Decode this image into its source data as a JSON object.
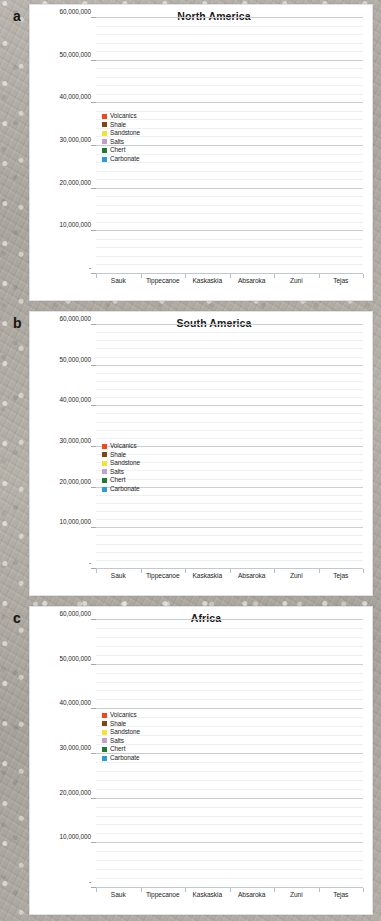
{
  "panels": [
    {
      "letter": "a",
      "title": "North America",
      "legend_top": "108px"
    },
    {
      "letter": "b",
      "title": "South America",
      "legend_top": "131px"
    },
    {
      "letter": "c",
      "title": "Africa",
      "legend_top": "105px"
    }
  ],
  "legend": {
    "items": [
      {
        "label": "Volcanics",
        "color": "#F0471B"
      },
      {
        "label": "Shale",
        "color": "#7B4A12"
      },
      {
        "label": "Sandstone",
        "color": "#F2E531"
      },
      {
        "label": "Salts",
        "color": "#C49FCB"
      },
      {
        "label": "Chert",
        "color": "#1F7A33"
      },
      {
        "label": "Carbonate",
        "color": "#2E9BD6"
      }
    ]
  },
  "axis": {
    "yticks": [
      "-",
      "10,000,000",
      "20,000,000",
      "30,000,000",
      "40,000,000",
      "50,000,000",
      "60,000,000"
    ],
    "ytick_values": [
      0,
      10000000,
      20000000,
      30000000,
      40000000,
      50000000,
      60000000
    ],
    "ymax": 60000000,
    "categories": [
      "Sauk",
      "Tippecanoe",
      "Kaskaskia",
      "Absaroka",
      "Zuni",
      "Tejas"
    ]
  },
  "chart_data": [
    {
      "type": "bar",
      "stacked": true,
      "title": "North America",
      "panel": "a",
      "xlabel": "",
      "ylabel": "",
      "ylim": [
        0,
        60000000
      ],
      "grid": true,
      "legend_position": "inside-upper-left",
      "categories": [
        "Sauk",
        "Tippecanoe",
        "Kaskaskia",
        "Absaroka",
        "Zuni",
        "Tejas"
      ],
      "series": [
        {
          "name": "Carbonate",
          "color": "#2E9BD6",
          "values": [
            1700000,
            2400000,
            1900000,
            1400000,
            3300000,
            1200000
          ]
        },
        {
          "name": "Chert",
          "color": "#1F7A33",
          "values": [
            80000,
            90000,
            90000,
            90000,
            120000,
            120000
          ]
        },
        {
          "name": "Salts",
          "color": "#C49FCB",
          "values": [
            0,
            0,
            0,
            0,
            0,
            0
          ]
        },
        {
          "name": "Sandstone",
          "color": "#F2E531",
          "values": [
            500000,
            600000,
            1700000,
            2400000,
            4800000,
            5700000
          ]
        },
        {
          "name": "Shale",
          "color": "#7B4A12",
          "values": [
            900000,
            1000000,
            1900000,
            2500000,
            7500000,
            7300000
          ]
        },
        {
          "name": "Volcanics",
          "color": "#F0471B",
          "values": [
            100000,
            100000,
            100000,
            200000,
            700000,
            3100000
          ]
        }
      ],
      "totals": [
        3280000,
        4190000,
        5690000,
        6590000,
        16420000,
        17420000
      ]
    },
    {
      "type": "bar",
      "stacked": true,
      "title": "South America",
      "panel": "b",
      "xlabel": "",
      "ylabel": "",
      "ylim": [
        0,
        60000000
      ],
      "grid": true,
      "legend_position": "inside-upper-left",
      "categories": [
        "Sauk",
        "Tippecanoe",
        "Kaskaskia",
        "Absaroka",
        "Zuni",
        "Tejas"
      ],
      "series": [
        {
          "name": "Carbonate",
          "color": "#2E9BD6",
          "values": [
            0,
            0,
            0,
            1400000,
            2100000,
            4000000
          ]
        },
        {
          "name": "Chert",
          "color": "#1F7A33",
          "values": [
            0,
            0,
            0,
            0,
            0,
            0
          ]
        },
        {
          "name": "Salts",
          "color": "#C49FCB",
          "values": [
            0,
            0,
            0,
            0,
            300000,
            0
          ]
        },
        {
          "name": "Sandstone",
          "color": "#F2E531",
          "values": [
            200000,
            500000,
            1100000,
            2700000,
            7000000,
            8800000
          ]
        },
        {
          "name": "Shale",
          "color": "#7B4A12",
          "values": [
            600000,
            1000000,
            1900000,
            2000000,
            12000000,
            19500000
          ]
        },
        {
          "name": "Volcanics",
          "color": "#F0471B",
          "values": [
            0,
            0,
            0,
            100000,
            1600000,
            700000
          ]
        }
      ],
      "totals": [
        800000,
        1500000,
        3000000,
        6200000,
        23000000,
        33000000
      ]
    },
    {
      "type": "bar",
      "stacked": true,
      "title": "Africa",
      "panel": "c",
      "xlabel": "",
      "ylabel": "",
      "ylim": [
        0,
        60000000
      ],
      "grid": true,
      "legend_position": "inside-upper-left",
      "categories": [
        "Sauk",
        "Tippecanoe",
        "Kaskaskia",
        "Absaroka",
        "Zuni",
        "Tejas"
      ],
      "series": [
        {
          "name": "Carbonate",
          "color": "#2E9BD6",
          "values": [
            0,
            0,
            300000,
            4600000,
            15900000,
            7400000
          ]
        },
        {
          "name": "Chert",
          "color": "#1F7A33",
          "values": [
            0,
            0,
            0,
            0,
            0,
            0
          ]
        },
        {
          "name": "Salts",
          "color": "#C49FCB",
          "values": [
            0,
            0,
            0,
            2000000,
            1100000,
            2400000
          ]
        },
        {
          "name": "Sandstone",
          "color": "#F2E531",
          "values": [
            4400000,
            2600000,
            900000,
            7700000,
            14300000,
            6500000
          ]
        },
        {
          "name": "Shale",
          "color": "#7B4A12",
          "values": [
            1800000,
            3600000,
            2600000,
            6200000,
            25100000,
            11000000
          ]
        },
        {
          "name": "Volcanics",
          "color": "#F0471B",
          "values": [
            0,
            0,
            0,
            500000,
            800000,
            1300000
          ]
        }
      ],
      "totals": [
        6200000,
        6200000,
        3800000,
        21000000,
        57200000,
        28600000
      ]
    }
  ]
}
